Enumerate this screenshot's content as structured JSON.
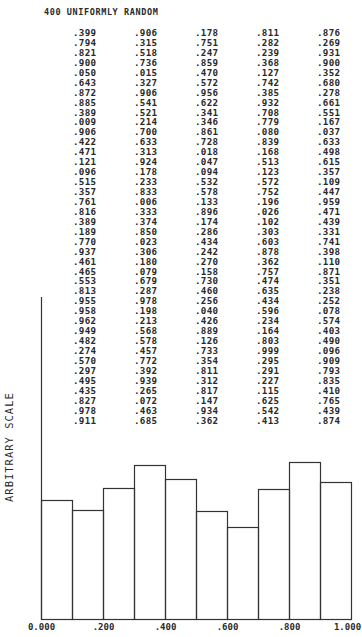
{
  "title": "400 UNIFORMLY RANDOM",
  "columns": [
    [
      ".399",
      ".794",
      ".821",
      ".900",
      ".050",
      ".643",
      ".872",
      ".885",
      ".389",
      ".009",
      ".906",
      ".422",
      ".471",
      ".121",
      ".096",
      ".515",
      ".357",
      ".761",
      ".816",
      ".389",
      ".189",
      ".770",
      ".937",
      ".461",
      ".465",
      ".553",
      ".813",
      ".955",
      ".958",
      ".962",
      ".949",
      ".482",
      ".274",
      ".570",
      ".297",
      ".495",
      ".435",
      ".827",
      ".978",
      ".911"
    ],
    [
      ".906",
      ".315",
      ".518",
      ".736",
      ".015",
      ".327",
      ".906",
      ".541",
      ".521",
      ".214",
      ".700",
      ".633",
      ".313",
      ".924",
      ".178",
      ".233",
      ".833",
      ".006",
      ".333",
      ".374",
      ".850",
      ".023",
      ".306",
      ".180",
      ".079",
      ".679",
      ".287",
      ".978",
      ".198",
      ".213",
      ".568",
      ".578",
      ".457",
      ".772",
      ".392",
      ".939",
      ".265",
      ".072",
      ".463",
      ".685"
    ],
    [
      ".178",
      ".751",
      ".247",
      ".859",
      ".470",
      ".572",
      ".956",
      ".622",
      ".341",
      ".346",
      ".861",
      ".728",
      ".018",
      ".047",
      ".094",
      ".532",
      ".578",
      ".133",
      ".896",
      ".174",
      ".286",
      ".434",
      ".242",
      ".270",
      ".158",
      ".730",
      ".460",
      ".256",
      ".040",
      ".426",
      ".889",
      ".126",
      ".733",
      ".354",
      ".811",
      ".312",
      ".817",
      ".147",
      ".934",
      ".362"
    ],
    [
      ".811",
      ".282",
      ".239",
      ".368",
      ".127",
      ".742",
      ".385",
      ".932",
      ".708",
      ".779",
      ".080",
      ".839",
      ".168",
      ".513",
      ".123",
      ".572",
      ".752",
      ".196",
      ".026",
      ".102",
      ".303",
      ".603",
      ".878",
      ".362",
      ".757",
      ".474",
      ".635",
      ".434",
      ".596",
      ".234",
      ".164",
      ".803",
      ".999",
      ".295",
      ".291",
      ".227",
      ".115",
      ".625",
      ".542",
      ".413"
    ],
    [
      ".876",
      ".269",
      ".931",
      ".900",
      ".352",
      ".680",
      ".278",
      ".661",
      ".551",
      ".167",
      ".037",
      ".633",
      ".498",
      ".615",
      ".357",
      ".109",
      ".447",
      ".959",
      ".471",
      ".439",
      ".331",
      ".741",
      ".398",
      ".110",
      ".871",
      ".351",
      ".238",
      ".252",
      ".078",
      ".574",
      ".403",
      ".490",
      ".096",
      ".909",
      ".793",
      ".835",
      ".410",
      ".765",
      ".439",
      ".874"
    ]
  ],
  "chart_data": {
    "type": "bar",
    "title": "400 UNIFORMLY RANDOM",
    "xlabel": "",
    "ylabel": "ARBITRARY SCALE",
    "categories": [
      "0.0-0.1",
      "0.1-0.2",
      "0.2-0.3",
      "0.3-0.4",
      "0.4-0.5",
      "0.5-0.6",
      "0.6-0.7",
      "0.7-0.8",
      "0.8-0.9",
      "0.9-1.0"
    ],
    "values": [
      119,
      109,
      131,
      154,
      140,
      108,
      92,
      130,
      157,
      137
    ],
    "value_note": "bar heights in pixels (arbitrary scale)",
    "x_tick_labels": [
      "0.000",
      ".200",
      ".400",
      ".600",
      ".800",
      "1.000"
    ],
    "x_ticks": [
      0.0,
      0.2,
      0.4,
      0.6,
      0.8,
      1.0
    ],
    "xlim": [
      0.0,
      1.0
    ],
    "grid": false,
    "legend": null
  },
  "axis": {
    "ylabel": "ARBITRARY SCALE"
  }
}
